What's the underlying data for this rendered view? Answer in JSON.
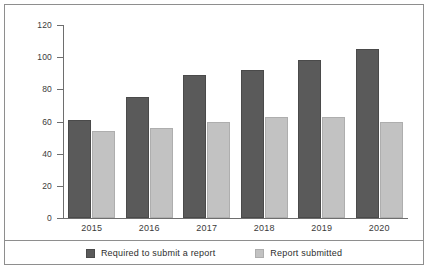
{
  "chart_data": {
    "type": "bar",
    "title": "",
    "xlabel": "",
    "ylabel": "No. of reports",
    "ylim": [
      0,
      120
    ],
    "yticks": [
      0,
      20,
      40,
      60,
      80,
      100,
      120
    ],
    "grid": false,
    "legend_position": "bottom",
    "categories": [
      "2015",
      "2016",
      "2017",
      "2018",
      "2019",
      "2020"
    ],
    "series": [
      {
        "name": "Required to submit a report",
        "color": "#5a5a5a",
        "values": [
          61,
          75,
          89,
          92,
          98,
          105
        ]
      },
      {
        "name": "Report submitted",
        "color": "#c2c2c2",
        "values": [
          54,
          56,
          60,
          63,
          63,
          60
        ]
      }
    ]
  },
  "legend": {
    "items": [
      {
        "label": "Required to submit a report",
        "color": "#5a5a5a"
      },
      {
        "label": "Report submitted",
        "color": "#c2c2c2"
      }
    ]
  },
  "axes": {
    "y_title": "No. of reports",
    "y_tick_labels": [
      "0",
      "20",
      "40",
      "60",
      "80",
      "100",
      "120"
    ],
    "x_tick_labels": [
      "2015",
      "2016",
      "2017",
      "2018",
      "2019",
      "2020"
    ]
  }
}
